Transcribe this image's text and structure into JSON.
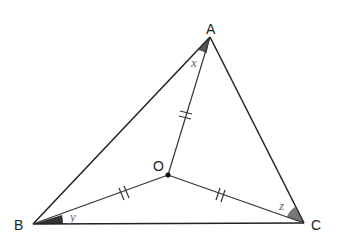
{
  "diagram": {
    "type": "triangle-with-interior-point",
    "vertices": {
      "A": {
        "label": "A",
        "x": 210,
        "y": 37
      },
      "B": {
        "label": "B",
        "x": 33,
        "y": 224
      },
      "C": {
        "label": "C",
        "x": 304,
        "y": 223
      }
    },
    "interior_point": {
      "label": "O",
      "x": 168,
      "y": 175
    },
    "angle_labels": {
      "at_A": "x",
      "at_B": "y",
      "at_C": "z"
    },
    "equal_segments": [
      "OA",
      "OB",
      "OC"
    ],
    "tick_mark": "double",
    "colors": {
      "line": "#222222",
      "angle_fill_A": "#555555",
      "angle_fill_B": "#333333",
      "angle_fill_C": "#777777",
      "angle_label": "#666666"
    }
  }
}
